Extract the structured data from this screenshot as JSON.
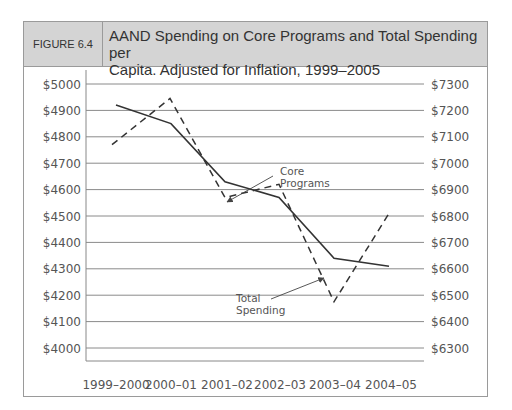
{
  "figure": {
    "label": "FIGURE 6.4",
    "title_line1": "AAND Spending on Core Programs and Total Spending per",
    "title_line2": "Capita. Adjusted for Inflation, 1999–2005"
  },
  "chart_data": {
    "type": "line",
    "title": "AAND Spending on Core Programs and Total Spending per Capita. Adjusted for Inflation, 1999–2005",
    "categories": [
      "1999–2000",
      "2000–01",
      "2001–02",
      "2002–03",
      "2003–04",
      "2004–05"
    ],
    "series": [
      {
        "name": "Core Programs",
        "axis": "left",
        "style": "solid",
        "values": [
          4920,
          4850,
          4630,
          4570,
          4340,
          4310
        ]
      },
      {
        "name": "Total Spending",
        "axis": "right",
        "style": "dashed",
        "values": [
          7070,
          7245,
          6870,
          6920,
          6475,
          6810
        ]
      }
    ],
    "left_axis": {
      "ticks": [
        "$5000",
        "$4900",
        "$4800",
        "$4700",
        "$4600",
        "$4500",
        "$4400",
        "$4300",
        "$4200",
        "$4100",
        "$4000"
      ],
      "ylim": [
        4000,
        5000
      ]
    },
    "right_axis": {
      "ticks": [
        "$7300",
        "$7200",
        "$7100",
        "$7000",
        "$6900",
        "$6800",
        "$6700",
        "$6600",
        "$6500",
        "$6400",
        "$6300"
      ],
      "ylim": [
        6300,
        7300
      ]
    },
    "annotations": [
      {
        "text_line1": "Core",
        "text_line2": "Programs"
      },
      {
        "text_line1": "Total",
        "text_line2": "Spending"
      }
    ],
    "grid": true,
    "legend": "annotations with arrows"
  }
}
